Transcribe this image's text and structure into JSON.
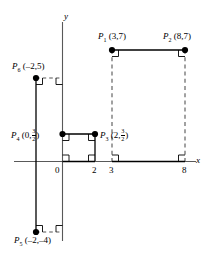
{
  "figure": {
    "axes": {
      "x_label": "x",
      "y_label": "y",
      "x_ticks": [
        "0",
        "2",
        "3",
        "8"
      ],
      "origin_label": "0"
    },
    "colors": {
      "line": "#000000",
      "axis": "#595959",
      "dash": "#666666",
      "point": "#000000"
    },
    "points": [
      {
        "name": "P",
        "sub": "1",
        "coord_text": "(3,7)",
        "x": 3,
        "y": 7
      },
      {
        "name": "P",
        "sub": "2",
        "coord_text": "(8,7)",
        "x": 8,
        "y": 7
      },
      {
        "name": "P",
        "sub": "3",
        "coord_pre": "(2,",
        "coord_num": "3",
        "coord_den": "2",
        "coord_post": ")",
        "x": 2,
        "y": 1.5
      },
      {
        "name": "P",
        "sub": "4",
        "coord_pre": "(0,",
        "coord_num": "3",
        "coord_den": "2",
        "coord_post": ")",
        "x": 0,
        "y": 1.5
      },
      {
        "name": "P",
        "sub": "5",
        "coord_text": "(–2,–4)",
        "x": -2,
        "y": -4
      },
      {
        "name": "P",
        "sub": "6",
        "coord_text": "(–2,5)",
        "x": -2,
        "y": 5
      }
    ]
  }
}
